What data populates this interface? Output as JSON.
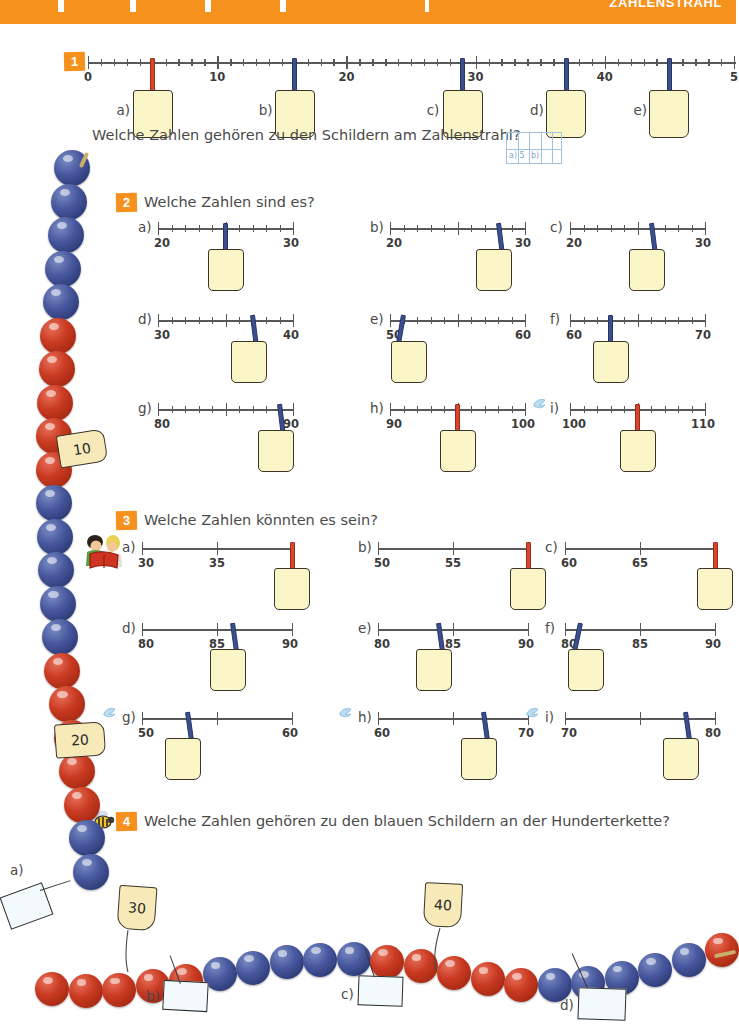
{
  "page": {
    "banner_title": "ZAHLENSTRAHL",
    "language": "de",
    "colors": {
      "orange": "#F6911E",
      "pin_blue": "#3C4F8C",
      "pin_red": "#D9452A",
      "card_yellow": "#FAF6C8",
      "bead_blue": "#48589E",
      "bead_red": "#C93A22",
      "tag_yellow": "#F7E9B8",
      "axis_gray": "#58585A",
      "text_gray": "#4A4A4A",
      "grid_blue": "#9FC3E0"
    }
  },
  "ex1": {
    "badge": "1",
    "prompt": "Welche Zahlen gehören zu den Schildern am Zahlenstrahl?",
    "axis": {
      "min": 0,
      "max": 50,
      "minor_step": 1,
      "major_step": 10
    },
    "major_labels": [
      "0",
      "10",
      "20",
      "30",
      "40",
      "5"
    ],
    "tags": [
      {
        "letter": "a)",
        "value": 5,
        "pin": "red"
      },
      {
        "letter": "b)",
        "value": 16,
        "pin": "blue"
      },
      {
        "letter": "c)",
        "value": 29,
        "pin": "blue"
      },
      {
        "letter": "d)",
        "value": 37,
        "pin": "blue"
      },
      {
        "letter": "e)",
        "value": 45,
        "pin": "blue"
      }
    ],
    "answer_grid": {
      "cols": 5,
      "rows": 2,
      "cell_a": "a) 5",
      "cell_b": "b)"
    }
  },
  "ex2": {
    "badge": "2",
    "prompt": "Welche Zahlen sind es?",
    "items": [
      {
        "letter": "a)",
        "start": "20",
        "end": "30",
        "value": 25,
        "pin": "blue",
        "icon": ""
      },
      {
        "letter": "b)",
        "start": "20",
        "end": "30",
        "value": 28,
        "pin": "blue",
        "icon": ""
      },
      {
        "letter": "c)",
        "start": "20",
        "end": "30",
        "value": 26,
        "pin": "blue",
        "icon": ""
      },
      {
        "letter": "d)",
        "start": "30",
        "end": "40",
        "value": 37,
        "pin": "blue",
        "icon": ""
      },
      {
        "letter": "e)",
        "start": "50",
        "end": "60",
        "value": 51,
        "pin": "blue",
        "icon": ""
      },
      {
        "letter": "f)",
        "start": "60",
        "end": "70",
        "value": 63,
        "pin": "blue",
        "icon": ""
      },
      {
        "letter": "g)",
        "start": "80",
        "end": "90",
        "value": 89,
        "pin": "blue",
        "icon": ""
      },
      {
        "letter": "h)",
        "start": "90",
        "end": "100",
        "value": 95,
        "pin": "red",
        "icon": ""
      },
      {
        "letter": "i)",
        "start": "100",
        "end": "110",
        "value": 105,
        "pin": "red",
        "icon": "bird-icon"
      }
    ]
  },
  "ex3": {
    "badge": "3",
    "prompt": "Welche Zahlen könnten es sein?",
    "icon": "children-reading-icon",
    "items": [
      {
        "letter": "a)",
        "labels": [
          "30",
          "35",
          ""
        ],
        "value": 40,
        "pin": "red",
        "icon": ""
      },
      {
        "letter": "b)",
        "labels": [
          "50",
          "55",
          ""
        ],
        "value": 60,
        "pin": "red",
        "icon": ""
      },
      {
        "letter": "c)",
        "labels": [
          "60",
          "65",
          ""
        ],
        "value": 70,
        "pin": "red",
        "icon": ""
      },
      {
        "letter": "d)",
        "labels": [
          "80",
          "85",
          "90"
        ],
        "value": 86,
        "pin": "blue",
        "icon": ""
      },
      {
        "letter": "e)",
        "labels": [
          "80",
          "85",
          "90"
        ],
        "value": 84,
        "pin": "blue",
        "icon": ""
      },
      {
        "letter": "f)",
        "labels": [
          "80",
          "85",
          "90"
        ],
        "value": 81,
        "pin": "blue",
        "icon": ""
      },
      {
        "letter": "g)",
        "labels": [
          "50",
          "",
          "60"
        ],
        "value": 53,
        "pin": "blue",
        "icon": "bird-icon"
      },
      {
        "letter": "h)",
        "labels": [
          "60",
          "",
          "70"
        ],
        "value": 67,
        "pin": "blue",
        "icon": "bird-icon"
      },
      {
        "letter": "i)",
        "labels": [
          "70",
          "",
          "80"
        ],
        "value": 78,
        "pin": "blue",
        "icon": "bird-icon"
      }
    ]
  },
  "ex4": {
    "badge": "4",
    "prompt": "Welche Zahlen gehören zu den blauen Schildern an der Hunderterkette?",
    "icon": "bee-icon",
    "number_tags": [
      "10",
      "20",
      "30",
      "40"
    ],
    "blank_labels": [
      "a)",
      "b)",
      "c)",
      "d)"
    ]
  }
}
